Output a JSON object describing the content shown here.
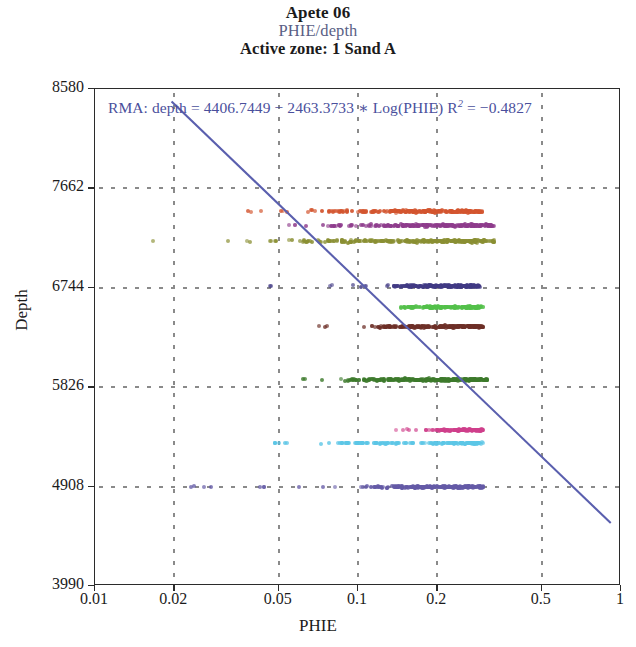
{
  "title": {
    "main": "Apete 06",
    "sub": "PHIE/depth",
    "zone": "Active zone: 1 Sand A",
    "sub_color": "#5a5f86"
  },
  "annotation": {
    "text": "RMA: depth = 4406.7449 − 2463.3733 ∗ Log(PHIE) R",
    "r2_sup": "2",
    "r2_value": " = −0.4827",
    "color": "#4a4f9c"
  },
  "chart_data": {
    "type": "scatter",
    "xlabel": "PHIE",
    "ylabel": "Depth",
    "xscale": "log",
    "yscale": "linear",
    "xlim": [
      0.01,
      1
    ],
    "ylim": [
      3990,
      8580
    ],
    "y_inverted": false,
    "grid": true,
    "legend": "none",
    "xticks": [
      0.01,
      0.02,
      0.05,
      0.1,
      0.2,
      0.5,
      1
    ],
    "xticklabels": [
      "0.01",
      "0.02",
      "0.05",
      "0.1",
      "0.2",
      "0.5",
      "1"
    ],
    "yticks": [
      8580,
      7662,
      6744,
      5826,
      4908,
      3990
    ],
    "yticklabels": [
      "8580",
      "7662",
      "6744",
      "5826",
      "4908",
      "3990"
    ],
    "gridlines_x": [
      0.02,
      0.05,
      0.1,
      0.2,
      0.5
    ],
    "gridlines_y": [
      7662,
      6744,
      5826,
      4908
    ],
    "fit_line": {
      "label": "RMA",
      "intercept": 4406.7449,
      "slope": -2463.3733,
      "transform": "log10",
      "r2": -0.4827,
      "color": "#5a5fae",
      "x_start": 0.0196,
      "y_start": 8465,
      "x_end": 0.93,
      "y_end": 4555
    },
    "series": [
      {
        "name": "band-orange",
        "color": "#d3552f",
        "depth": 7450,
        "depth_jitter": 16,
        "x_main": [
          0.062,
          0.3
        ],
        "x_outliers": [
          0.0385,
          0.043,
          0.052
        ],
        "n": 230,
        "density": "dense"
      },
      {
        "name": "band-purple",
        "color": "#8e3c8c",
        "depth": 7320,
        "depth_jitter": 16,
        "x_main": [
          0.072,
          0.33
        ],
        "x_outliers": [
          0.056,
          0.062
        ],
        "n": 210,
        "density": "dense"
      },
      {
        "name": "band-olive",
        "color": "#8a8f33",
        "depth": 7175,
        "depth_jitter": 18,
        "x_main": [
          0.046,
          0.33
        ],
        "x_outliers": [
          0.0162,
          0.031,
          0.038
        ],
        "n": 260,
        "density": "dense"
      },
      {
        "name": "band-navy",
        "color": "#413a84",
        "depth": 6760,
        "depth_jitter": 16,
        "x_main": [
          0.125,
          0.29
        ],
        "x_outliers": [
          0.047,
          0.077,
          0.095,
          0.105
        ],
        "n": 190,
        "density": "dense"
      },
      {
        "name": "band-green",
        "color": "#53c04a",
        "depth": 6565,
        "depth_jitter": 14,
        "x_main": [
          0.135,
          0.3
        ],
        "x_outliers": [],
        "n": 180,
        "density": "dense"
      },
      {
        "name": "band-maroon",
        "color": "#6d2f27",
        "depth": 6385,
        "depth_jitter": 15,
        "x_main": [
          0.102,
          0.3
        ],
        "x_outliers": [
          0.074
        ],
        "n": 210,
        "density": "dense"
      },
      {
        "name": "band-darkgreen",
        "color": "#3d7a2c",
        "depth": 5895,
        "depth_jitter": 17,
        "x_main": [
          0.082,
          0.31
        ],
        "x_outliers": [
          0.062,
          0.07
        ],
        "n": 270,
        "density": "dense"
      },
      {
        "name": "band-pink",
        "color": "#cf3f8b",
        "depth": 5430,
        "depth_jitter": 12,
        "x_main": [
          0.175,
          0.3
        ],
        "x_outliers": [
          0.135,
          0.15,
          0.16
        ],
        "n": 120,
        "density": "medium"
      },
      {
        "name": "band-cyan",
        "color": "#5cc6e6",
        "depth": 5310,
        "depth_jitter": 12,
        "x_main": [
          0.06,
          0.3
        ],
        "x_outliers": [
          0.047,
          0.052
        ],
        "n": 150,
        "density": "medium"
      },
      {
        "name": "band-violet",
        "color": "#645aa6",
        "depth": 4905,
        "depth_jitter": 15,
        "x_main": [
          0.095,
          0.3
        ],
        "x_outliers": [
          0.024,
          0.027,
          0.043,
          0.058,
          0.072,
          0.08
        ],
        "n": 230,
        "density": "dense"
      }
    ]
  },
  "axis": {
    "x_title": "PHIE",
    "y_title": "Depth"
  }
}
